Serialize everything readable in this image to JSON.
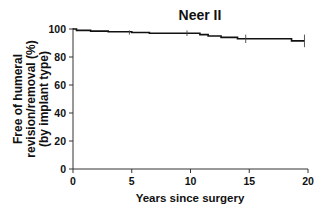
{
  "chart_data": {
    "type": "line",
    "style": "kaplan-meier step curve",
    "title": "Neer II",
    "xlabel": "Years since surgery",
    "ylabel_lines": [
      "Free of humeral",
      "revision/removal (%)",
      "(by implant type)"
    ],
    "ylabel": "Free of humeral revision/removal (%) (by implant type)",
    "xlim": [
      0,
      20
    ],
    "ylim": [
      0,
      100
    ],
    "x_ticks": [
      0,
      5,
      10,
      15,
      20
    ],
    "y_ticks": [
      0,
      20,
      40,
      60,
      80,
      100
    ],
    "grid": false,
    "legend": null,
    "series": [
      {
        "name": "Neer II",
        "color": "#111111",
        "steps": [
          {
            "x": 0,
            "y": 100
          },
          {
            "x": 0.3,
            "y": 99
          },
          {
            "x": 1.5,
            "y": 98.5
          },
          {
            "x": 3.0,
            "y": 98
          },
          {
            "x": 5.0,
            "y": 97.5
          },
          {
            "x": 6.5,
            "y": 97
          },
          {
            "x": 10.8,
            "y": 96
          },
          {
            "x": 11.5,
            "y": 95
          },
          {
            "x": 12.6,
            "y": 94
          },
          {
            "x": 14.0,
            "y": 93
          },
          {
            "x": 18.6,
            "y": 91.5
          },
          {
            "x": 19.7,
            "y": 91.5
          }
        ],
        "error_bars": [
          {
            "x": 4.8,
            "y": 97.5,
            "low": 96,
            "high": 99
          },
          {
            "x": 9.7,
            "y": 97,
            "low": 95,
            "high": 99
          },
          {
            "x": 14.7,
            "y": 93,
            "low": 90,
            "high": 96
          },
          {
            "x": 19.7,
            "y": 91.5,
            "low": 87,
            "high": 96
          }
        ]
      }
    ]
  }
}
